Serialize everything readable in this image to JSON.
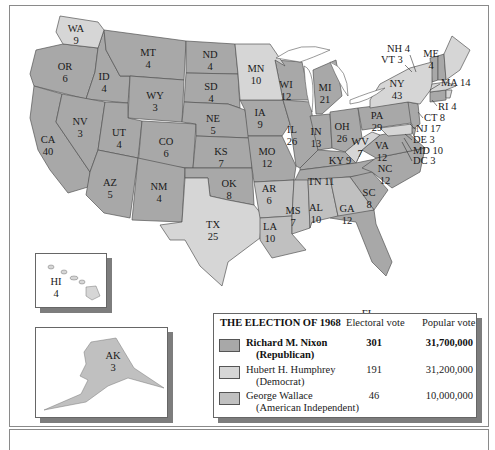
{
  "legend": {
    "title": "THE ELECTION OF 1968",
    "col_electoral": "Electoral vote",
    "col_popular": "Popular vote",
    "candidates": [
      {
        "name": "Richard M. Nixon",
        "party": "(Republican)",
        "electoral": "301",
        "popular": "31,700,000",
        "color": "#a8a8a8",
        "bold": true
      },
      {
        "name": "Hubert H. Humphrey",
        "party": "(Democrat)",
        "electoral": "191",
        "popular": "31,200,000",
        "color": "#d6d6d6",
        "bold": false
      },
      {
        "name": "George Wallace",
        "party": "(American Independent)",
        "electoral": "46",
        "popular": "10,000,000",
        "color": "#c0c0c0",
        "bold": false
      }
    ]
  },
  "colors": {
    "nixon": "#a8a8a8",
    "humphrey": "#d6d6d6",
    "wallace": "#c0c0c0",
    "border": "#555555",
    "shadow": "#7d7d7d"
  },
  "states": {
    "WA": {
      "abbr": "WA",
      "ev": "9"
    },
    "OR": {
      "abbr": "OR",
      "ev": "6"
    },
    "CA": {
      "abbr": "CA",
      "ev": "40"
    },
    "ID": {
      "abbr": "ID",
      "ev": "4"
    },
    "NV": {
      "abbr": "NV",
      "ev": "3"
    },
    "MT": {
      "abbr": "MT",
      "ev": "4"
    },
    "WY": {
      "abbr": "WY",
      "ev": "3"
    },
    "UT": {
      "abbr": "UT",
      "ev": "4"
    },
    "AZ": {
      "abbr": "AZ",
      "ev": "5"
    },
    "CO": {
      "abbr": "CO",
      "ev": "6"
    },
    "NM": {
      "abbr": "NM",
      "ev": "4"
    },
    "ND": {
      "abbr": "ND",
      "ev": "4"
    },
    "SD": {
      "abbr": "SD",
      "ev": "4"
    },
    "NE": {
      "abbr": "NE",
      "ev": "5"
    },
    "KS": {
      "abbr": "KS",
      "ev": "7"
    },
    "OK": {
      "abbr": "OK",
      "ev": "8"
    },
    "TX": {
      "abbr": "TX",
      "ev": "25"
    },
    "MN": {
      "abbr": "MN",
      "ev": "10"
    },
    "IA": {
      "abbr": "IA",
      "ev": "9"
    },
    "MO": {
      "abbr": "MO",
      "ev": "12"
    },
    "AR": {
      "abbr": "AR",
      "ev": "6"
    },
    "LA": {
      "abbr": "LA",
      "ev": "10"
    },
    "WI": {
      "abbr": "WI",
      "ev": "12"
    },
    "IL": {
      "abbr": "IL",
      "ev": "26"
    },
    "MI": {
      "abbr": "MI",
      "ev": "21"
    },
    "IN": {
      "abbr": "IN",
      "ev": "13"
    },
    "OH": {
      "abbr": "OH",
      "ev": "26"
    },
    "KY": {
      "abbr": "KY",
      "ev": "9"
    },
    "TN": {
      "abbr": "TN",
      "ev": "11"
    },
    "MS": {
      "abbr": "MS",
      "ev": "7"
    },
    "AL": {
      "abbr": "AL",
      "ev": "10"
    },
    "GA": {
      "abbr": "GA",
      "ev": "12"
    },
    "FL": {
      "abbr": "FL",
      "ev": "14"
    },
    "SC": {
      "abbr": "SC",
      "ev": "8"
    },
    "NC": {
      "abbr": "NC",
      "ev": "12"
    },
    "VA": {
      "abbr": "VA",
      "ev": "12"
    },
    "WV": {
      "abbr": "WV",
      "ev": "7"
    },
    "PA": {
      "abbr": "PA",
      "ev": "29"
    },
    "NY": {
      "abbr": "NY",
      "ev": "43"
    },
    "ME": {
      "abbr": "ME",
      "ev": "4"
    },
    "HI": {
      "abbr": "HI",
      "ev": "4"
    },
    "AK": {
      "abbr": "AK",
      "ev": "3"
    }
  },
  "callouts": {
    "NH": "NH 4",
    "VT": "VT 3",
    "MA": "MA 14",
    "RI": "RI 4",
    "CT": "CT 8",
    "NJ": "NJ 17",
    "DE": "DE 3",
    "MD": "MD 10",
    "DC": "DC 3"
  }
}
